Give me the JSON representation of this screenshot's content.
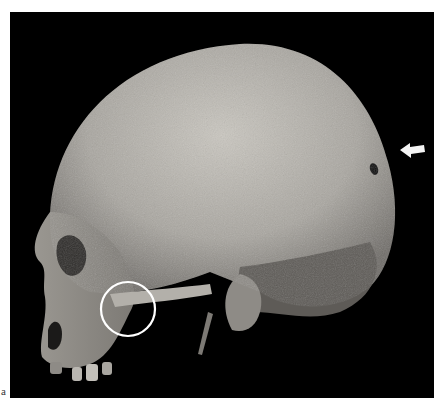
{
  "figure": {
    "panel_label": "a",
    "background_color": "#000000",
    "annotations": [
      {
        "type": "arrow",
        "color": "#ffffff",
        "direction": "left",
        "points_to": "small perforation on parietal/occipital region"
      },
      {
        "type": "circle",
        "color": "#ffffff",
        "marks": "temporomandibular / zygomatic root region"
      }
    ]
  }
}
